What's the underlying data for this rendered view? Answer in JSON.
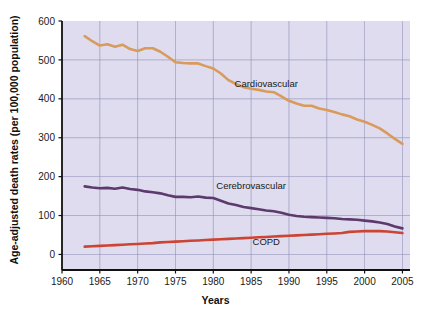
{
  "chart_data": {
    "type": "line",
    "title": "",
    "xlabel": "Years",
    "ylabel": "Age-adjusted death rates (per 100,000 population)",
    "xlim": [
      1960,
      2006
    ],
    "ylim": [
      -40,
      600
    ],
    "xticks": [
      1960,
      1965,
      1970,
      1975,
      1980,
      1985,
      1990,
      1995,
      2000,
      2005
    ],
    "xtick_labels": [
      "1960",
      "1965",
      "1970",
      "1975",
      "1980",
      "1985",
      "1990",
      "1995",
      "2000",
      "2005"
    ],
    "yticks": [
      0,
      100,
      200,
      300,
      400,
      500,
      600
    ],
    "ytick_labels": [
      "0",
      "100",
      "200",
      "300",
      "400",
      "500",
      "600"
    ],
    "grid": true,
    "grid_color": "#8f8fb8",
    "plot_background": "#dedcee",
    "legend_position": "inline-annotations",
    "x": [
      1963,
      1964,
      1965,
      1966,
      1967,
      1968,
      1969,
      1970,
      1971,
      1972,
      1973,
      1974,
      1975,
      1976,
      1977,
      1978,
      1979,
      1980,
      1981,
      1982,
      1983,
      1984,
      1985,
      1986,
      1987,
      1988,
      1989,
      1990,
      1991,
      1992,
      1993,
      1994,
      1995,
      1996,
      1997,
      1998,
      1999,
      2000,
      2001,
      2002,
      2003,
      2004,
      2005
    ],
    "series": [
      {
        "name": "Cardiovascular",
        "color": "#d99b5c",
        "label_x": 1987,
        "label_y": 430,
        "values": [
          561,
          548,
          537,
          540,
          534,
          539,
          528,
          523,
          530,
          530,
          521,
          508,
          494,
          492,
          491,
          491,
          484,
          478,
          465,
          448,
          438,
          430,
          426,
          423,
          419,
          417,
          406,
          395,
          388,
          382,
          382,
          375,
          371,
          366,
          360,
          355,
          347,
          341,
          333,
          324,
          311,
          297,
          284
        ]
      },
      {
        "name": "Cerebrovascular",
        "color": "#5d3a6e",
        "label_x": 1985,
        "label_y": 168,
        "values": [
          175,
          172,
          170,
          171,
          169,
          172,
          168,
          166,
          162,
          160,
          157,
          152,
          148,
          148,
          147,
          149,
          146,
          145,
          138,
          131,
          127,
          122,
          119,
          116,
          113,
          111,
          107,
          102,
          99,
          97,
          96,
          95,
          94,
          93,
          91,
          90,
          89,
          87,
          85,
          82,
          78,
          72,
          67
        ]
      },
      {
        "name": "COPD",
        "color": "#cc4433",
        "label_x": 1987,
        "label_y": 25,
        "values": [
          20,
          21,
          22,
          23,
          24,
          25,
          26,
          27,
          28,
          29,
          31,
          32,
          33,
          34,
          35,
          36,
          37,
          38,
          39,
          40,
          41,
          42,
          43,
          44,
          45,
          46,
          47,
          48,
          49,
          50,
          51,
          52,
          53,
          54,
          55,
          58,
          59,
          60,
          60,
          60,
          59,
          57,
          55
        ]
      }
    ]
  }
}
